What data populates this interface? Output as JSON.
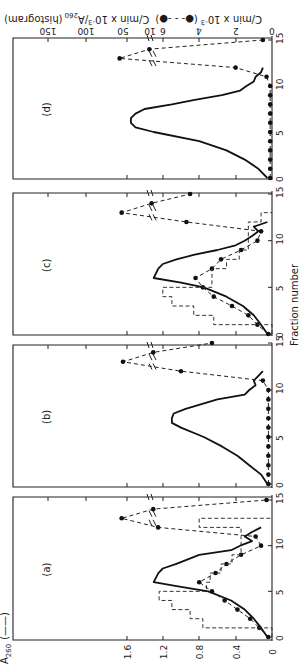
{
  "figure": {
    "orientation": "rotated 90 degrees counter-clockwise",
    "xlabel": "Fraction number",
    "left_axis_label": "A260 (——)",
    "right_axis_label": "C/min x 10^-3 (●- - -●)  C/min x 10^-3/A260 (histogram)",
    "right_axis_label_parts": {
      "dots": "C/min x 10",
      "dots_exp": "-3",
      "dots_legend": "(●- - -●)",
      "hist": "C/min x 10",
      "hist_exp": "-3",
      "hist_div": "/A",
      "hist_sub": "260",
      "hist_legend": "(histogram)"
    },
    "a260_label": "A",
    "a260_sub": "260",
    "a260_legend": "(——)",
    "panel_labels": [
      "(d)",
      "(c)",
      "(b)",
      "(a)"
    ],
    "x_ticks": [
      "0",
      "5",
      "10",
      "15"
    ],
    "a260_ticks": [
      "0",
      "0.4",
      "0.8",
      "1.2",
      "1.6"
    ],
    "cpm_ticks_low": [
      "0",
      "2",
      "4",
      "6"
    ],
    "cpm_ticks_high": [
      "10",
      "50"
    ],
    "hist_ticks_high": [
      "100",
      "150"
    ]
  },
  "chart_data": [
    {
      "panel": "(a)",
      "type": "line",
      "xlabel": "Fraction number",
      "ylabel_left": "A260",
      "ylabel_right": "C/min x 10^-3 ; C/min x 10^-3/A260 (histogram)",
      "x": [
        0,
        1,
        2,
        3,
        4,
        5,
        6,
        7,
        8,
        9,
        10,
        11,
        12,
        13,
        14,
        15
      ],
      "series": [
        {
          "name": "A260 (solid)",
          "x": [
            0,
            1,
            2,
            3,
            4,
            5,
            5.5,
            6,
            7,
            7.5,
            8,
            9,
            9.5,
            10,
            10.5,
            11,
            11.5,
            12
          ],
          "values": [
            0.05,
            0.12,
            0.2,
            0.3,
            0.45,
            0.7,
            1.0,
            1.3,
            1.25,
            1.2,
            1.05,
            0.8,
            0.45,
            0.35,
            0.22,
            0.3,
            0.22,
            0.12
          ]
        },
        {
          "name": "C/min x 10^-3 (dots)",
          "x": [
            0,
            1,
            2,
            3,
            4,
            5,
            6,
            7,
            8,
            9,
            10,
            11,
            12,
            13,
            14,
            15
          ],
          "values": [
            0.2,
            0.7,
            1.2,
            1.9,
            2.6,
            3.3,
            4.0,
            3.1,
            2.5,
            1.7,
            0.6,
            0.9,
            7.5,
            52,
            9.0,
            0.3
          ]
        },
        {
          "name": "C/min x 10^-3/A260 (histogram)",
          "x": [
            0,
            1,
            2,
            3,
            4,
            5,
            6,
            7,
            8,
            9,
            10,
            11,
            12
          ],
          "values": [
            0,
            3.8,
            4.5,
            5.5,
            6.2,
            3.6,
            3.4,
            2.8,
            2.2,
            1.7,
            1.7,
            1.7,
            4.0
          ]
        }
      ],
      "x_ticks": [
        0,
        5,
        10,
        15
      ],
      "ylim_left": [
        0,
        1.8
      ]
    },
    {
      "panel": "(b)",
      "type": "line",
      "xlabel": "Fraction number",
      "x": [
        0,
        1,
        2,
        3,
        4,
        5,
        6,
        7,
        8,
        9,
        10,
        11,
        12,
        13,
        14,
        15
      ],
      "series": [
        {
          "name": "A260 (solid)",
          "x": [
            0,
            1,
            2,
            3,
            4,
            5,
            6,
            6.5,
            7,
            7.5,
            8,
            9,
            9.5,
            10,
            10.5,
            11,
            11.5,
            12
          ],
          "values": [
            0.05,
            0.12,
            0.25,
            0.38,
            0.55,
            0.75,
            1.0,
            1.1,
            1.1,
            1.08,
            0.95,
            0.6,
            0.3,
            0.25,
            0.18,
            0.2,
            0.15,
            0.1
          ]
        },
        {
          "name": "C/min x 10^-3 (dots)",
          "x": [
            0,
            1,
            2,
            3,
            4,
            5,
            6,
            7,
            8,
            9,
            10,
            11,
            12,
            13,
            14,
            15
          ],
          "values": [
            0.2,
            0.2,
            0.2,
            0.2,
            0.2,
            0.2,
            0.2,
            0.2,
            0.2,
            0.2,
            0.2,
            0.5,
            5.0,
            50,
            9.0,
            3.3
          ]
        }
      ],
      "x_ticks": [
        0,
        5,
        10,
        15
      ],
      "ylim_left": [
        0,
        1.8
      ]
    },
    {
      "panel": "(c)",
      "type": "line",
      "xlabel": "Fraction number",
      "x": [
        0,
        1,
        2,
        3,
        4,
        5,
        6,
        7,
        8,
        9,
        10,
        11,
        12,
        13,
        14,
        15
      ],
      "series": [
        {
          "name": "A260 (solid)",
          "x": [
            0,
            1,
            2,
            3,
            4,
            5,
            5.5,
            6,
            7,
            7.5,
            8,
            8.5,
            9,
            9.5,
            10,
            10.5,
            11,
            11.5,
            12
          ],
          "values": [
            0.05,
            0.12,
            0.2,
            0.32,
            0.5,
            0.75,
            1.0,
            1.3,
            1.25,
            1.2,
            1.05,
            0.85,
            0.6,
            0.4,
            0.3,
            0.22,
            0.15,
            0.2,
            0.05
          ]
        },
        {
          "name": "C/min x 10^-3 (dots)",
          "x": [
            0,
            1,
            2,
            3,
            4,
            5,
            6,
            7,
            8,
            9,
            10,
            11,
            12,
            13,
            14,
            15
          ],
          "values": [
            0.2,
            0.8,
            1.3,
            2.2,
            3.2,
            3.8,
            4.2,
            3.3,
            2.8,
            1.7,
            0.8,
            0.6,
            4.7,
            52,
            9.5,
            4.5
          ]
        },
        {
          "name": "C/min x 10^-3/A260 (histogram)",
          "x": [
            0,
            1,
            2,
            3,
            4,
            5,
            6,
            7,
            8,
            9,
            10,
            11,
            12
          ],
          "values": [
            0,
            3.2,
            4.3,
            5.5,
            6.0,
            3.3,
            3.3,
            2.5,
            1.8,
            1.3,
            1.3,
            1.3,
            0.6
          ]
        }
      ],
      "x_ticks": [
        0,
        5,
        10,
        15
      ],
      "ylim_left": [
        0,
        1.8
      ]
    },
    {
      "panel": "(d)",
      "type": "line",
      "xlabel": "Fraction number",
      "x": [
        0,
        1,
        2,
        3,
        4,
        5,
        6,
        7,
        8,
        9,
        10,
        11,
        12,
        13,
        14,
        15
      ],
      "series": [
        {
          "name": "A260 (solid)",
          "x": [
            0,
            1,
            2,
            3,
            4,
            5,
            5.5,
            6,
            6.5,
            7,
            7.5,
            8,
            8.5,
            9,
            9.5,
            10,
            10.5,
            11,
            11.5,
            12
          ],
          "values": [
            0.05,
            0.15,
            0.3,
            0.5,
            0.8,
            1.3,
            1.5,
            1.55,
            1.55,
            1.5,
            1.4,
            1.1,
            0.85,
            0.55,
            0.35,
            0.28,
            0.2,
            0.18,
            0.12,
            0.1
          ]
        },
        {
          "name": "C/min x 10^-3 (dots)",
          "x": [
            0,
            1,
            2,
            3,
            4,
            5,
            6,
            7,
            8,
            9,
            10,
            11,
            12,
            13,
            14,
            15
          ],
          "values": [
            0.1,
            0.1,
            0.1,
            0.1,
            0.1,
            0.1,
            0.1,
            0.1,
            0.1,
            0.1,
            0.1,
            0.3,
            2.0,
            55,
            11,
            0.5
          ]
        }
      ],
      "x_ticks": [
        0,
        5,
        10,
        15
      ],
      "ylim_left": [
        0,
        1.8
      ]
    }
  ]
}
